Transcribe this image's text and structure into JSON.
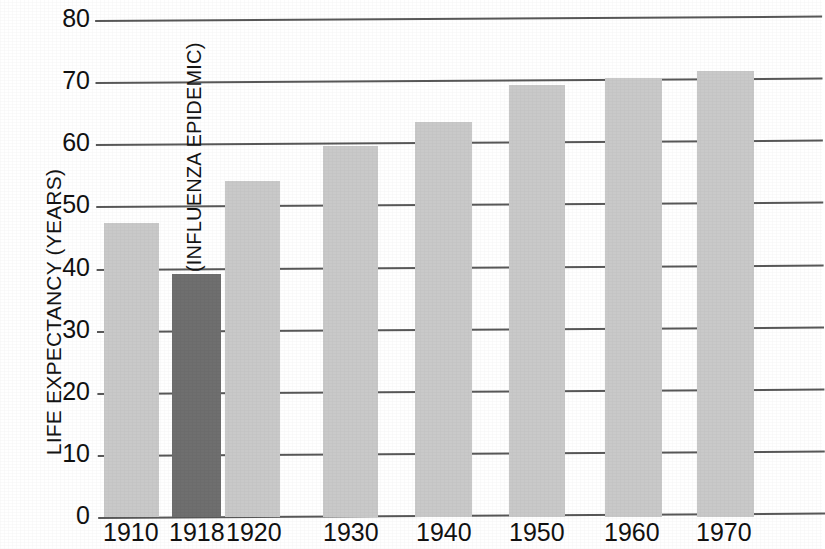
{
  "chart_data": {
    "type": "bar",
    "title": "",
    "xlabel": "",
    "ylabel": "LIFE EXPECTANCY (YEARS)",
    "categories": [
      "1910",
      "1918",
      "1920",
      "1930",
      "1940",
      "1950",
      "1960",
      "1970"
    ],
    "values": [
      47.3,
      39.1,
      54.1,
      59.7,
      63.6,
      69.6,
      70.6,
      71.8
    ],
    "ylim": [
      0,
      80
    ],
    "yticks": [
      0,
      10,
      20,
      30,
      40,
      50,
      60,
      70,
      80
    ],
    "ytick_labels": [
      "0",
      "10",
      "20",
      "30",
      "40",
      "50",
      "60",
      "70",
      "80"
    ],
    "grid": true,
    "legend": "none",
    "annotations": [
      {
        "text": "(INFLUENZA EPIDEMIC)",
        "points_to_category": "1918",
        "orientation": "vertical"
      }
    ],
    "bar_colors": [
      "#c9c9c9",
      "#6f6f6f",
      "#c9c9c9",
      "#c9c9c9",
      "#c9c9c9",
      "#c9c9c9",
      "#c9c9c9",
      "#c9c9c9"
    ],
    "highlight_color": "#6f6f6f",
    "bar_color": "#c9c9c9",
    "gridline_color": "#585858"
  },
  "axis": {
    "y_label": "LIFE EXPECTANCY (YEARS)"
  },
  "annotation": {
    "influenza": "(INFLUENZA EPIDEMIC)"
  }
}
